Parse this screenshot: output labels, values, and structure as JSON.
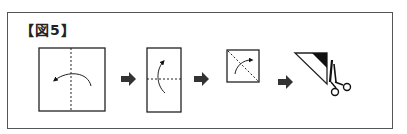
{
  "figure": {
    "title": "【図5】",
    "steps": [
      {
        "name": "step-1-square-fold-vertical",
        "description": "square with vertical dashed fold line and curved arrow folding right half to left"
      },
      {
        "name": "step-2-rectangle-fold-horizontal",
        "description": "tall rectangle with horizontal dashed fold line and curved arrow folding bottom up"
      },
      {
        "name": "step-3-square-fold-diagonal",
        "description": "small square with diagonal dashed fold line and curved arrow"
      },
      {
        "name": "step-4-triangle-cut",
        "description": "folded triangle with black-filled corner to cut off with scissors"
      }
    ],
    "arrows_between_steps": 3,
    "colors": {
      "line": "#222222",
      "frame": "#555555",
      "fill": "#111111",
      "arrow": "#333333"
    }
  }
}
